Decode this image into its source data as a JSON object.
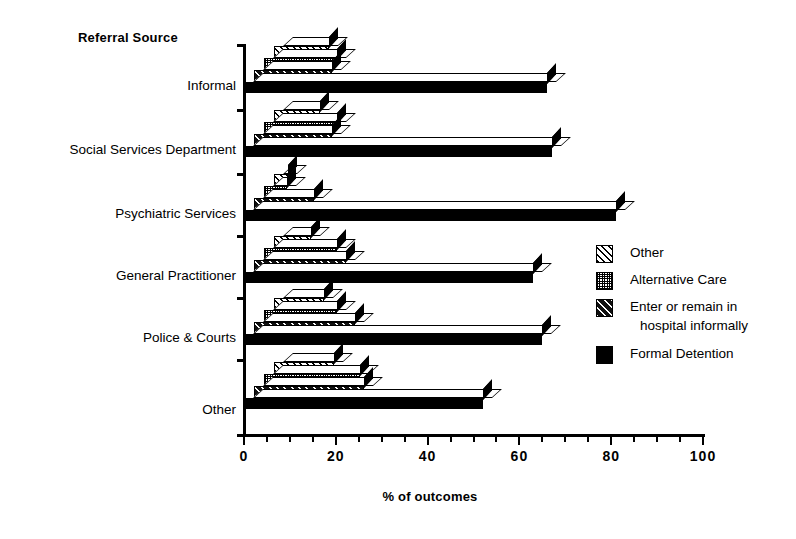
{
  "chart_data": {
    "type": "bar",
    "orientation": "horizontal",
    "stacked": false,
    "title": "",
    "ylabel": "Referral Source",
    "xlabel": "% of outcomes",
    "xlim": [
      0,
      100
    ],
    "xticks": [
      0,
      20,
      40,
      60,
      80,
      100
    ],
    "xtick_labels": [
      "0",
      "20",
      "40",
      "60",
      "80",
      "100"
    ],
    "minor_tick_step": 5,
    "grid": false,
    "legend_position": "right",
    "categories": [
      "Informal",
      "Social Services Department",
      "Psychiatric Services",
      "General Practitioner",
      "Police & Courts",
      "Other"
    ],
    "series": [
      {
        "name": "Other",
        "pattern": "wide-diagonal-hatch",
        "values": [
          12,
          10,
          3,
          8,
          11,
          13
        ]
      },
      {
        "name": "Alternative Care",
        "pattern": "dense-dot-grid",
        "values": [
          16,
          16,
          5,
          16,
          16,
          21
        ]
      },
      {
        "name": "Enter or remain in hospital informally",
        "pattern": "narrow-diagonal-hatch",
        "values": [
          17,
          17,
          13,
          20,
          22,
          24
        ]
      },
      {
        "name": "Formal Detention",
        "pattern": "solid-black",
        "values": [
          66,
          67,
          81,
          63,
          65,
          52
        ]
      }
    ]
  },
  "axes": {
    "y_axis_title": "Referral Source",
    "x_axis_title": "% of outcomes"
  },
  "legend": {
    "items": [
      {
        "label": "Other",
        "label2": ""
      },
      {
        "label": "Alternative Care",
        "label2": ""
      },
      {
        "label": "Enter or remain in",
        "label2": "hospital informally"
      },
      {
        "label": "Formal Detention",
        "label2": ""
      }
    ]
  },
  "colors": {
    "ink": "#000000",
    "paper": "#ffffff"
  }
}
